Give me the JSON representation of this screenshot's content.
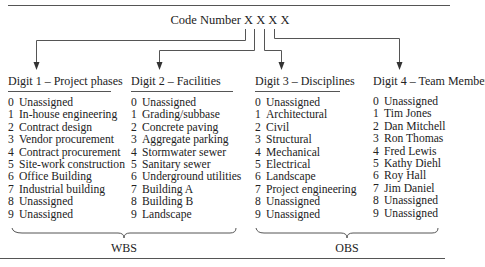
{
  "diagram": {
    "title": "Code Number X X X X",
    "columns": [
      {
        "header": "Digit 1 – Project phases",
        "items": [
          {
            "num": "0",
            "label": "Unassigned"
          },
          {
            "num": "1",
            "label": "In-house engineering"
          },
          {
            "num": "2",
            "label": "Contract design"
          },
          {
            "num": "3",
            "label": "Vendor procurement"
          },
          {
            "num": "4",
            "label": "Contract procurement"
          },
          {
            "num": "5",
            "label": "Site-work construction"
          },
          {
            "num": "6",
            "label": "Office Building"
          },
          {
            "num": "7",
            "label": "Industrial building"
          },
          {
            "num": "8",
            "label": "Unassigned"
          },
          {
            "num": "9",
            "label": "Unassigned"
          }
        ]
      },
      {
        "header": "Digit 2 – Facilities",
        "items": [
          {
            "num": "0",
            "label": "Unassigned"
          },
          {
            "num": "1",
            "label": "Grading/subbase"
          },
          {
            "num": "2",
            "label": "Concrete paving"
          },
          {
            "num": "3",
            "label": "Aggregate parking"
          },
          {
            "num": "4",
            "label": "Stormwater sewer"
          },
          {
            "num": "5",
            "label": "Sanitary sewer"
          },
          {
            "num": "6",
            "label": "Underground utilities"
          },
          {
            "num": "7",
            "label": "Building A"
          },
          {
            "num": "8",
            "label": "Building B"
          },
          {
            "num": "9",
            "label": "Landscape"
          }
        ]
      },
      {
        "header": "Digit 3 – Disciplines",
        "items": [
          {
            "num": "0",
            "label": "Unassigned"
          },
          {
            "num": "1",
            "label": "Architectural"
          },
          {
            "num": "2",
            "label": "Civil"
          },
          {
            "num": "3",
            "label": "Structural"
          },
          {
            "num": "4",
            "label": "Mechanical"
          },
          {
            "num": "5",
            "label": "Electrical"
          },
          {
            "num": "6",
            "label": "Landscape"
          },
          {
            "num": "7",
            "label": "Project engineering"
          },
          {
            "num": "8",
            "label": "Unassigned"
          },
          {
            "num": "9",
            "label": "Unassigned"
          }
        ]
      },
      {
        "header": "Digit 4 – Team Members",
        "items": [
          {
            "num": "0",
            "label": "Unassigned"
          },
          {
            "num": "1",
            "label": "Tim Jones"
          },
          {
            "num": "2",
            "label": "Dan Mitchell"
          },
          {
            "num": "3",
            "label": "Ron Thomas"
          },
          {
            "num": "4",
            "label": "Fred Lewis"
          },
          {
            "num": "5",
            "label": "Kathy Diehl"
          },
          {
            "num": "6",
            "label": "Roy Hall"
          },
          {
            "num": "7",
            "label": "Jim Daniel"
          },
          {
            "num": "8",
            "label": "Unassigned"
          },
          {
            "num": "9",
            "label": "Unassigned"
          }
        ]
      }
    ],
    "groups": [
      {
        "label": "WBS",
        "spans": "Digit 1 – Digit 2"
      },
      {
        "label": "OBS",
        "spans": "Digit 3 – Digit 4"
      }
    ],
    "colors": {
      "line": "#555555",
      "text": "#222222",
      "background": "#ffffff"
    }
  }
}
